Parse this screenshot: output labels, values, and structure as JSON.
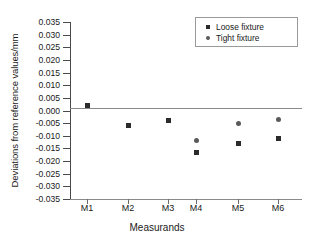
{
  "chart_data": {
    "type": "scatter",
    "title": "",
    "xlabel": "Measurands",
    "ylabel": "Deviations from reference values/mm",
    "categories": [
      "M1",
      "M2",
      "M3",
      "M4",
      "M5",
      "M6"
    ],
    "ylim": [
      -0.035,
      0.035
    ],
    "ytick_labels": [
      "0.035",
      "0.030",
      "0.025",
      "0.020",
      "0.015",
      "0.010",
      "0.005",
      "0.000",
      "-0.005",
      "-0.010",
      "-0.015",
      "-0.020",
      "-0.025",
      "-0.030",
      "-0.035"
    ],
    "ytick_values": [
      0.035,
      0.03,
      0.025,
      0.02,
      0.015,
      0.01,
      0.005,
      0.0,
      -0.005,
      -0.01,
      -0.015,
      -0.02,
      -0.025,
      -0.03,
      -0.035
    ],
    "grid": false,
    "legend_position": "top-right",
    "zero_reference_line": 0.0,
    "series": [
      {
        "name": "Loose fixture",
        "marker": "square",
        "color": "#2b2b2b",
        "x": [
          "M1",
          "M2",
          "M3",
          "M4",
          "M5",
          "M6"
        ],
        "values": [
          0.002,
          -0.006,
          -0.004,
          -0.0165,
          -0.013,
          -0.011
        ]
      },
      {
        "name": "Tight fixture",
        "marker": "circle",
        "color": "#5a5a5a",
        "x": [
          "M4",
          "M5",
          "M6"
        ],
        "values": [
          -0.012,
          -0.005,
          -0.0035
        ]
      }
    ]
  },
  "legend": {
    "items": [
      {
        "label": "Loose fixture",
        "marker": "square-marker-icon"
      },
      {
        "label": "Tight fixture",
        "marker": "circle-marker-icon"
      }
    ]
  }
}
